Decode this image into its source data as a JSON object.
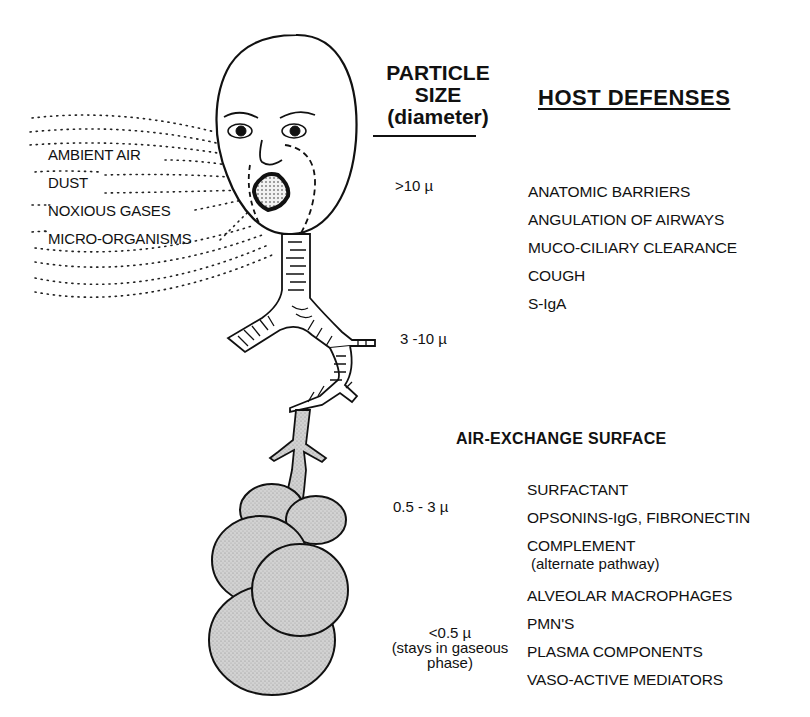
{
  "inhaled_agents": [
    "AMBIENT AIR",
    "DUST",
    "NOXIOUS GASES",
    "MICRO-ORGANISMS"
  ],
  "particle_size_header": {
    "line1": "PARTICLE",
    "line2": "SIZE",
    "line3": "(diameter)"
  },
  "host_defenses_header": "HOST  DEFENSES",
  "air_exchange_header": "AIR-EXCHANGE  SURFACE",
  "particle_sizes": {
    "upper_airway": ">10 µ",
    "large_airways": "3 -10 µ",
    "small_airways": "0.5 - 3 µ",
    "alveoli": "<0.5 µ",
    "alveoli_note_line1": "(stays in gaseous",
    "alveoli_note_line2": "phase)"
  },
  "airway_defenses": [
    "ANATOMIC BARRIERS",
    "ANGULATION OF AIRWAYS",
    "MUCO-CILIARY CLEARANCE",
    "COUGH",
    "S-IgA"
  ],
  "alveolar_defenses": {
    "surfactant": "SURFACTANT",
    "opsonins": "OPSONINS-IgG, FIBRONECTIN",
    "complement": "COMPLEMENT",
    "complement_note": "(alternate pathway)",
    "macrophages": "ALVEOLAR MACROPHAGES",
    "pmns": "PMN'S",
    "plasma": "PLASMA COMPONENTS",
    "vasoactive": "VASO-ACTIVE MEDIATORS"
  },
  "colors": {
    "ink": "#111111",
    "alveolar_fill": "#c8c8c8",
    "background": "#ffffff"
  }
}
